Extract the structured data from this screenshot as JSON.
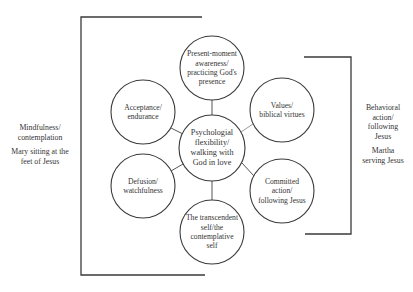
{
  "diagram": {
    "colors": {
      "line": "#3a3a3a",
      "connector": "#555555",
      "text": "#333333",
      "background": "#ffffff"
    },
    "center": {
      "id": "center",
      "label": "Psychologial flexibility/ walking with God in love",
      "lines": [
        "Psychologial",
        "flexibility/",
        "walking with",
        "God in love"
      ],
      "cx": 212,
      "cy": 148,
      "r": 33
    },
    "nodes": [
      {
        "id": "present",
        "lines": [
          "Present-moment",
          "awareness/",
          "practicing God's",
          "presence"
        ],
        "cx": 212,
        "cy": 68,
        "r": 32
      },
      {
        "id": "values",
        "lines": [
          "Values/",
          "biblical virtues"
        ],
        "cx": 282,
        "cy": 110,
        "r": 32
      },
      {
        "id": "committed",
        "lines": [
          "Committed",
          "action/",
          "following Jesus"
        ],
        "cx": 282,
        "cy": 191,
        "r": 32
      },
      {
        "id": "self",
        "lines": [
          "The transcendent",
          "self/the",
          "contemplative",
          "self"
        ],
        "cx": 212,
        "cy": 232,
        "r": 32
      },
      {
        "id": "defusion",
        "lines": [
          "Defusion/",
          "watchfulness"
        ],
        "cx": 143,
        "cy": 186,
        "r": 32
      },
      {
        "id": "acceptance",
        "lines": [
          "Acceptance/",
          "endurance"
        ],
        "cx": 143,
        "cy": 112,
        "r": 32
      }
    ],
    "left_group": {
      "labels": [
        "Mindfulness/ contemplation",
        "Mary sitting at the feet of Jesus"
      ],
      "label1_lines": [
        "Mindfulness/",
        "contemplation"
      ],
      "label2_lines": [
        "Mary sitting at the",
        "feet of Jesus"
      ],
      "bracket": {
        "x": 81,
        "top": 17,
        "bottom": 275,
        "top_end": 202,
        "bottom_end": 205
      }
    },
    "right_group": {
      "labels": [
        "Behavioral action/ following Jesus",
        "Martha serving Jesus"
      ],
      "label1_lines": [
        "Behavioral",
        "action/",
        "following",
        "Jesus"
      ],
      "label2_lines": [
        "Martha",
        "serving Jesus"
      ],
      "bracket": {
        "x": 351,
        "top": 57,
        "bottom": 234,
        "top_start": 304,
        "bottom_start": 305
      }
    }
  }
}
